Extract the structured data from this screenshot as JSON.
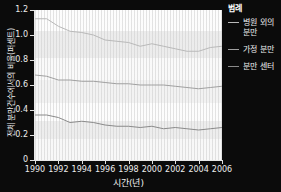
{
  "chart_data": {
    "type": "line",
    "title": "",
    "xlabel": "시간(년)",
    "ylabel": "전체 분만건수에서의 비율(퍼센트)",
    "xlim": [
      1990,
      2006
    ],
    "ylim": [
      0,
      1.2
    ],
    "grid": true,
    "legend_position": "right",
    "legend_title": "범례",
    "xticks": [
      "1990",
      "1992",
      "1994",
      "1996",
      "1998",
      "2000",
      "2002",
      "2004",
      "2006"
    ],
    "xtick_values": [
      1990,
      1992,
      1994,
      1996,
      1998,
      2000,
      2002,
      2004,
      2006
    ],
    "yticks": [
      "0",
      "0.2",
      "0.4",
      "0.6",
      "0.8",
      "1.0",
      "1.2"
    ],
    "ytick_values": [
      0,
      0.2,
      0.4,
      0.6,
      0.8,
      1.0,
      1.2
    ],
    "x": [
      1990,
      1991,
      1992,
      1993,
      1994,
      1995,
      1996,
      1997,
      1998,
      1999,
      2000,
      2001,
      2002,
      2003,
      2004,
      2005,
      2006
    ],
    "series": [
      {
        "name": "병원 외의 분만",
        "color": "#b9b9b9",
        "values": [
          1.13,
          1.13,
          1.07,
          1.03,
          1.02,
          1.0,
          0.96,
          0.95,
          0.94,
          0.91,
          0.93,
          0.91,
          0.89,
          0.87,
          0.87,
          0.9,
          0.91
        ]
      },
      {
        "name": "가정 분만",
        "color": "#a0a0a0",
        "values": [
          0.68,
          0.67,
          0.64,
          0.64,
          0.63,
          0.63,
          0.62,
          0.61,
          0.61,
          0.6,
          0.6,
          0.6,
          0.59,
          0.58,
          0.57,
          0.58,
          0.59
        ]
      },
      {
        "name": "분만 센터",
        "color": "#8a8a8a",
        "values": [
          0.36,
          0.36,
          0.34,
          0.3,
          0.31,
          0.3,
          0.28,
          0.27,
          0.27,
          0.26,
          0.27,
          0.25,
          0.26,
          0.25,
          0.24,
          0.25,
          0.26
        ]
      }
    ]
  },
  "axis": {
    "x_title": "시간(년)",
    "y_title": "전체 분만건수에서의 비율(퍼센트)"
  },
  "legend": {
    "title": "범례",
    "items": [
      {
        "label": "병원 외의 분만"
      },
      {
        "label": "가정 분만"
      },
      {
        "label": "분만 센터"
      }
    ]
  },
  "colors": {
    "background": "#0b0b0b",
    "plot_background": "#f4f4f4",
    "text": "#f0f0f0",
    "line_1": "#b9b9b9",
    "line_2": "#a0a0a0",
    "line_3": "#8a8a8a"
  }
}
